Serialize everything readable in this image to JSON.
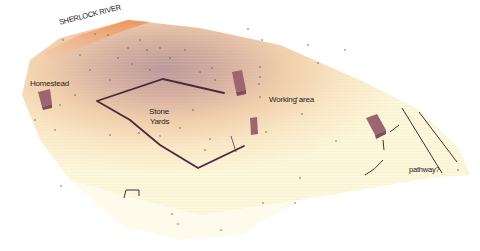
{
  "map": {
    "title": "Site terrain survey",
    "labels": {
      "river": "SHERLOCK RIVER",
      "homestead": "Homestead",
      "stone_yards_line1": "Stone",
      "stone_yards_line2": "Yards",
      "working_area": "Working area",
      "pathway": "pathway?"
    },
    "colors": {
      "terrain_high": "#b99090",
      "terrain_mid": "#efc7a0",
      "terrain_low": "#fdf6d8",
      "river_edge": "#f09050",
      "wall": "#4a2a3a",
      "building": "#9c6670",
      "survey_point": "#5a6a5a"
    },
    "features": [
      {
        "type": "building",
        "name": "Homestead"
      },
      {
        "type": "building",
        "name": "Working area building 1"
      },
      {
        "type": "building",
        "name": "Working area building 2"
      },
      {
        "type": "building",
        "name": "East building"
      },
      {
        "type": "wall",
        "name": "Stone yards wall"
      },
      {
        "type": "wall",
        "name": "Pathway edge (2 lines)"
      },
      {
        "type": "wall",
        "name": "Small bracket wall"
      }
    ]
  }
}
